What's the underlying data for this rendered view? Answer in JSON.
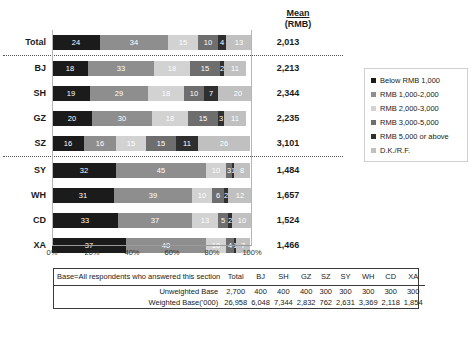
{
  "mean_header": {
    "line1": "Mean",
    "line2": "(RMB)"
  },
  "chart_data": {
    "type": "bar",
    "orientation": "horizontal",
    "stacked": true,
    "title": "",
    "xlabel": "",
    "ylabel": "",
    "xlim": [
      0,
      100
    ],
    "xticks": [
      "0%",
      "20%",
      "40%",
      "60%",
      "80%",
      "100%"
    ],
    "grid": false,
    "legend_position": "right",
    "series": [
      {
        "name": "Below RMB 1,000",
        "color": "#1b1b1b",
        "values": [
          24,
          18,
          19,
          20,
          16,
          32,
          31,
          33,
          37
        ]
      },
      {
        "name": "RMB 1,000-2,000",
        "color": "#8e8e8e",
        "values": [
          34,
          33,
          29,
          30,
          16,
          45,
          39,
          37,
          40
        ]
      },
      {
        "name": "RMB 2,000-3,000",
        "color": "#d2d2d2",
        "values": [
          15,
          18,
          18,
          18,
          15,
          10,
          10,
          13,
          10
        ]
      },
      {
        "name": "RMB 3,000-5,000",
        "color": "#6e6e6e",
        "values": [
          10,
          15,
          10,
          15,
          15,
          3,
          6,
          5,
          4
        ]
      },
      {
        "name": "RMB 5,000 or above",
        "color": "#2f2f2f",
        "values": [
          4,
          2,
          7,
          3,
          11,
          1,
          2,
          2,
          1
        ]
      },
      {
        "name": "D.K./R.F.",
        "color": "#c0c0c0",
        "values": [
          13,
          11,
          20,
          11,
          26,
          8,
          12,
          10,
          7
        ]
      }
    ],
    "categories": [
      "Total",
      "BJ",
      "SH",
      "GZ",
      "SZ",
      "SY",
      "WH",
      "CD",
      "XA"
    ],
    "mean_values": [
      "2,013",
      "2,213",
      "2,344",
      "2,235",
      "3,101",
      "1,484",
      "1,657",
      "1,524",
      "1,466"
    ]
  },
  "legend": {
    "items": [
      {
        "label": "Below RMB 1,000"
      },
      {
        "label": "RMB 1,000-2,000"
      },
      {
        "label": "RMB 2,000-3,000"
      },
      {
        "label": "RMB 3,000-5,000"
      },
      {
        "label": "RMB 5,000 or above"
      },
      {
        "label": "D.K./R.F."
      }
    ]
  },
  "base_table": {
    "desc": "Base=All respondents who answered this section",
    "columns": [
      "Total",
      "BJ",
      "SH",
      "GZ",
      "SZ",
      "SY",
      "WH",
      "CD",
      "XA"
    ],
    "rows": [
      {
        "label": "Unweighted Base",
        "values": [
          "2,700",
          "400",
          "400",
          "400",
          "300",
          "300",
          "300",
          "300",
          "300"
        ]
      },
      {
        "label": "Weighted Base('000)",
        "values": [
          "26,958",
          "6,048",
          "7,344",
          "2,832",
          "762",
          "2,631",
          "3,369",
          "2,118",
          "1,854"
        ]
      }
    ]
  }
}
